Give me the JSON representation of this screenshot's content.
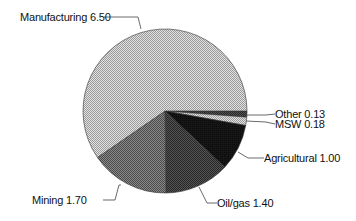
{
  "chart_data": {
    "type": "pie",
    "title": "",
    "start_angle_deg": 0,
    "direction": "clockwise",
    "slices": [
      {
        "label": "Other",
        "value": 0.13,
        "display": "Other 0.13",
        "fill": "#6e6e6e",
        "pattern": "dots-dark"
      },
      {
        "label": "MSW",
        "value": 0.18,
        "display": "MSW 0.18",
        "fill": "#bdbdbd",
        "pattern": "dots-light"
      },
      {
        "label": "Agricultural",
        "value": 1.0,
        "display": "Agricultural 1.00",
        "fill": "#151515",
        "pattern": "solid-dark"
      },
      {
        "label": "Oil/gas",
        "value": 1.4,
        "display": "Oil/gas 1.40",
        "fill": "#3c3c3c",
        "pattern": "dots-dark"
      },
      {
        "label": "Mining",
        "value": 1.7,
        "display": "Mining 1.70",
        "fill": "#6a6a6a",
        "pattern": "dots-mid"
      },
      {
        "label": "Manufacturing",
        "value": 6.5,
        "display": "Manufacturing 6.50",
        "fill": "#c8c8c8",
        "pattern": "dots-light"
      }
    ],
    "total": 10.91,
    "legend": "none (leader-line labels)"
  },
  "labels": {
    "other": "Other 0.13",
    "msw": "MSW 0.18",
    "agricultural": "Agricultural 1.00",
    "oilgas": "Oil/gas 1.40",
    "mining": "Mining 1.70",
    "manufacturing": "Manufacturing 6.50"
  }
}
